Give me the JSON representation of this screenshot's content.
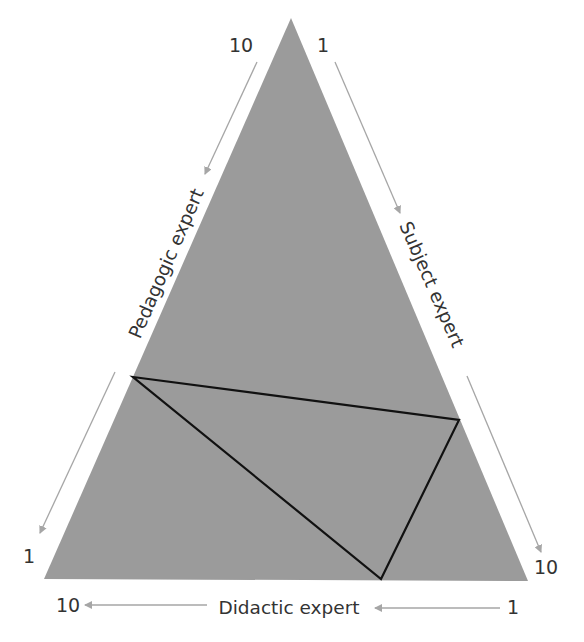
{
  "diagram": {
    "type": "triangle-diagram",
    "colors": {
      "fill": "#9b9b9b",
      "inner_stroke": "#111111",
      "arrow": "#a6a6a6",
      "text": "#333333"
    },
    "outer_triangle": {
      "apex": [
        291,
        18
      ],
      "bottom_left": [
        44,
        579
      ],
      "bottom_right": [
        528,
        581
      ]
    },
    "inner_triangle": {
      "left": [
        133,
        377
      ],
      "right": [
        459,
        420
      ],
      "bottom": [
        381,
        579
      ]
    },
    "axes": {
      "left": {
        "label": "Pedagogic expert",
        "top_value": "10",
        "bottom_value": "1"
      },
      "right": {
        "label": "Subject expert",
        "top_value": "1",
        "bottom_value": "10"
      },
      "bottom": {
        "label": "Didactic expert",
        "left_value": "10",
        "right_value": "1"
      }
    }
  }
}
